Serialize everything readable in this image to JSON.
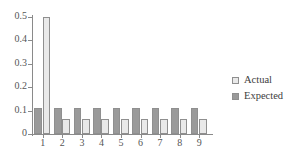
{
  "chart_data": {
    "type": "bar",
    "title": "",
    "subtitle": "",
    "xlabel": "",
    "ylabel": "",
    "categories": [
      "1",
      "2",
      "3",
      "4",
      "5",
      "6",
      "7",
      "8",
      "9"
    ],
    "series": [
      {
        "name": "Expected",
        "color": "#9a9a9a",
        "values": [
          0.111,
          0.111,
          0.111,
          0.111,
          0.111,
          0.111,
          0.111,
          0.111,
          0.111
        ]
      },
      {
        "name": "Actual",
        "color": "#e9e9e9",
        "values": [
          0.5,
          0.0625,
          0.0625,
          0.0625,
          0.0625,
          0.0625,
          0.0625,
          0.0625,
          0.0625
        ]
      }
    ],
    "group_order": [
      "Expected",
      "Actual"
    ],
    "ylim": [
      0,
      0.5
    ],
    "yticks": [
      0,
      0.1,
      0.2,
      0.3,
      0.4,
      0.5
    ],
    "ytick_labels": [
      "0",
      "0.1",
      "0.2",
      "0.3",
      "0.4",
      "0.5"
    ],
    "xtick_labels": [
      "1",
      "2",
      "3",
      "4",
      "5",
      "6",
      "7",
      "8",
      "9"
    ],
    "grid": false,
    "legend_position": "right",
    "legend": [
      {
        "label": "Actual",
        "color": "#e9e9e9"
      },
      {
        "label": "Expected",
        "color": "#9a9a9a"
      }
    ]
  },
  "axis": {
    "line_color": "#8a8a8a"
  }
}
